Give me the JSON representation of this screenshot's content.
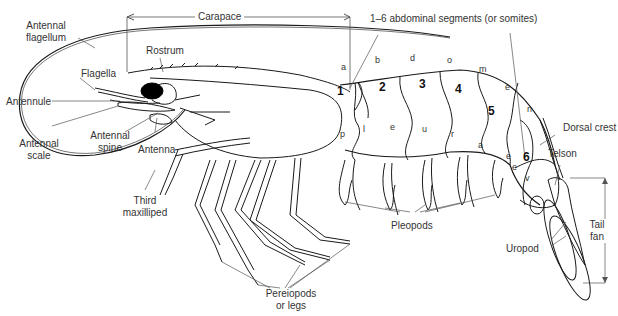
{
  "diagram": {
    "labels": {
      "antennal_flagellum": "Antennal\nflagellum",
      "antennal_flagellum_l1": "Antennal",
      "antennal_flagellum_l2": "flagellum",
      "carapace": "Carapace",
      "rostrum": "Rostrum",
      "flagella": "Flagella",
      "antennule": "Antennule",
      "antennal_scale_l1": "Antennal",
      "antennal_scale_l2": "scale",
      "antennal_spine_l1": "Antennal",
      "antennal_spine_l2": "spine",
      "antenna": "Antenna",
      "third_maxilliped_l1": "Third",
      "third_maxilliped_l2": "maxilliped",
      "abdominal_segments": "1–6 abdominal segments (or somites)",
      "dorsal_crest": "Dorsal crest",
      "telson": "Telson",
      "tail_fan_l1": "Tail",
      "tail_fan_l2": "fan",
      "uropod": "Uropod",
      "pleopods": "Pleopods",
      "pereiopods_l1": "Pereiopods",
      "pereiopods_l2": "or legs"
    },
    "segment_numbers": [
      "1",
      "2",
      "3",
      "4",
      "5",
      "6"
    ],
    "abdomen_word_letters": [
      "a",
      "b",
      "d",
      "o",
      "m",
      "e",
      "n"
    ],
    "pleura_letters": [
      "p",
      "l",
      "e",
      "u",
      "r",
      "a"
    ],
    "segment6_letters": [
      "e",
      "e",
      "v"
    ],
    "colors": {
      "line": "#1a1a1a",
      "leader": "#555555",
      "text": "#333333",
      "eye": "#000000"
    }
  }
}
